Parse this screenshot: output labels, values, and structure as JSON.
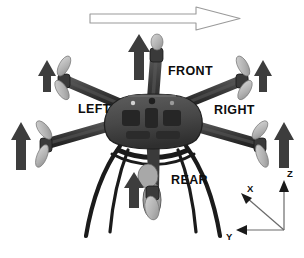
{
  "figure": {
    "background_color": "#ffffff",
    "width": 304,
    "height": 258
  },
  "subject": {
    "name": "hexacopter-airframe",
    "description": "Six-rotor multirotor airframe viewed from above and front, with landing gear",
    "rotor_count": 6,
    "frame_color": "#4a4a4a",
    "arm_color": "#3a3a3a",
    "propeller_color": "#b9b9b9",
    "landing_gear_color": "#1c1c1c"
  },
  "heading_arrow": {
    "name": "heading-direction-arrow",
    "style": "hollow-outline",
    "direction": "right",
    "stroke_color": "#8a8a8a",
    "fill_color": "#ffffff",
    "meaning": "forward flight direction"
  },
  "direction_labels": [
    {
      "id": "front",
      "text": "FRONT",
      "x": 168,
      "y": 65
    },
    {
      "id": "left",
      "text": "LEFT",
      "x": 78,
      "y": 103
    },
    {
      "id": "right",
      "text": "RIGHT",
      "x": 214,
      "y": 104
    },
    {
      "id": "rear",
      "text": "REAR",
      "x": 171,
      "y": 174
    }
  ],
  "thrust_arrows": {
    "name": "motor-thrust-arrows",
    "color": "#3d3d3d",
    "direction": "up",
    "count": 6,
    "items": [
      {
        "id": "thrust-front-center",
        "x": 139,
        "y_top": 36,
        "y_bottom": 80,
        "width": 13
      },
      {
        "id": "thrust-front-left",
        "x": 47,
        "y_top": 62,
        "y_bottom": 90,
        "width": 11
      },
      {
        "id": "thrust-front-right",
        "x": 263,
        "y_top": 62,
        "y_bottom": 90,
        "width": 11
      },
      {
        "id": "thrust-rear-left",
        "x": 21,
        "y_top": 125,
        "y_bottom": 168,
        "width": 12
      },
      {
        "id": "thrust-rear-right",
        "x": 284,
        "y_top": 125,
        "y_bottom": 165,
        "width": 12
      },
      {
        "id": "thrust-rear-center",
        "x": 134,
        "y_top": 175,
        "y_bottom": 205,
        "width": 12
      }
    ]
  },
  "coordinate_frame": {
    "name": "body-coordinate-axes",
    "origin": {
      "x": 284,
      "y": 230
    },
    "line_color": "#6b6b6b",
    "arrow_color": "#1a1a1a",
    "axes": [
      {
        "id": "axis-x",
        "label": "X",
        "tip": {
          "x": 242,
          "y": 193
        },
        "label_pos": {
          "x": 247,
          "y": 184
        },
        "direction": "up-left diagonal"
      },
      {
        "id": "axis-y",
        "label": "Y",
        "tip": {
          "x": 238,
          "y": 230
        },
        "label_pos": {
          "x": 226,
          "y": 232
        },
        "direction": "left"
      },
      {
        "id": "axis-z",
        "label": "Z",
        "tip": {
          "x": 284,
          "y": 182
        },
        "label_pos": {
          "x": 287,
          "y": 171
        },
        "direction": "up"
      }
    ]
  }
}
